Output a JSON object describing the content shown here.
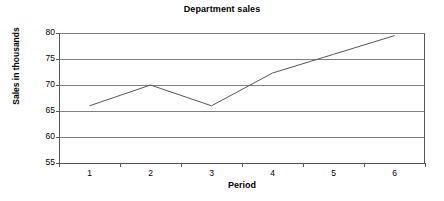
{
  "chart_data": {
    "type": "line",
    "title": "Department sales",
    "xlabel": "Period",
    "ylabel": "Sales in thousands",
    "categories": [
      "1",
      "2",
      "3",
      "4",
      "5",
      "6"
    ],
    "values": [
      66,
      70,
      66,
      72.3,
      75.9,
      79.5
    ],
    "series": [
      {
        "name": "Department sales",
        "values": [
          66,
          70,
          66,
          72.3,
          75.9,
          79.5
        ]
      }
    ],
    "ylim": [
      55,
      80
    ],
    "yticks": [
      55,
      60,
      65,
      70,
      75,
      80
    ],
    "ytick_labels": [
      "55",
      "60",
      "65",
      "70",
      "75",
      "80"
    ],
    "grid": true,
    "grid_axis": "y",
    "legend": false,
    "markers": false,
    "colors": {
      "line": "#555555",
      "grid": "#808080",
      "axis": "#555555",
      "background": "#ffffff",
      "text": "#000000"
    }
  }
}
